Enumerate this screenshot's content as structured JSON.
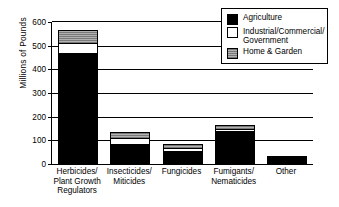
{
  "chart_data": {
    "type": "bar",
    "subtype": "stacked-vertical",
    "title": "",
    "xlabel": "",
    "ylabel": "Millions of Pounds",
    "ylim": [
      0,
      600
    ],
    "yticks": [
      0,
      100,
      200,
      300,
      400,
      500,
      600
    ],
    "ytick_labels": [
      "0",
      "100",
      "200",
      "300",
      "400",
      "500",
      "600"
    ],
    "grid": "horizontal",
    "legend_position": "top-right",
    "categories": [
      "Herbicides/\nPlant Growth\nRegulators",
      "Insecticides/\nMiticides",
      "Fungicides",
      "Fumigants/\nNematicides",
      "Other"
    ],
    "series": [
      {
        "name": "Agriculture",
        "color": "#000000",
        "values": [
          470,
          85,
          55,
          140,
          28
        ]
      },
      {
        "name": "Industrial/Commercial/\nGovernment",
        "color": "#ffffff",
        "values": [
          40,
          25,
          13,
          8,
          5
        ]
      },
      {
        "name": "Home & Garden",
        "color": "#9b9b9b",
        "values": [
          57,
          25,
          17,
          17,
          0
        ]
      }
    ],
    "totals": [
      567,
      135,
      85,
      165,
      33
    ]
  },
  "legend": {
    "entries": [
      {
        "label": "Agriculture",
        "swatch": "black-swatch"
      },
      {
        "label": "Industrial/Commercial/\nGovernment",
        "swatch": "white-swatch"
      },
      {
        "label": "Home & Garden",
        "swatch": "gray-swatch"
      }
    ]
  },
  "axis": {
    "y_title": "Millions of Pounds"
  }
}
